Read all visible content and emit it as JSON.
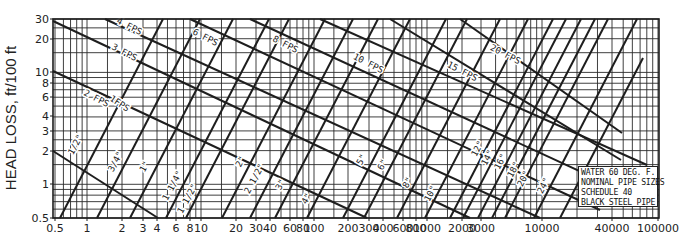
{
  "chart_data": {
    "type": "line",
    "title": "",
    "xlabel": "",
    "ylabel": "HEAD LOSS, ft/100 ft",
    "x_scale": "log",
    "y_scale": "log",
    "xlim": [
      0.5,
      100000
    ],
    "ylim": [
      0.5,
      30
    ],
    "grid": true,
    "x_ticks": [
      {
        "v": 0.5,
        "label": "0.5",
        "px": 55
      },
      {
        "v": 1,
        "label": "1",
        "px": 87
      },
      {
        "v": 2,
        "label": "2",
        "px": 122
      },
      {
        "v": 3,
        "label": "3",
        "px": 143
      },
      {
        "v": 4,
        "label": "4",
        "px": 157
      },
      {
        "v": 6,
        "label": "6",
        "px": 176
      },
      {
        "v": 8,
        "label": "8",
        "px": 190
      },
      {
        "v": 10,
        "label": "10",
        "px": 201
      },
      {
        "v": 20,
        "label": "20",
        "px": 236
      },
      {
        "v": 30,
        "label": "30",
        "px": 256
      },
      {
        "v": 40,
        "label": "40",
        "px": 270
      },
      {
        "v": 60,
        "label": "60",
        "px": 290
      },
      {
        "v": 80,
        "label": "80",
        "px": 303
      },
      {
        "v": 100,
        "label": "100",
        "px": 314
      },
      {
        "v": 200,
        "label": "200",
        "px": 348
      },
      {
        "v": 300,
        "label": "300",
        "px": 369
      },
      {
        "v": 400,
        "label": "400",
        "px": 383
      },
      {
        "v": 600,
        "label": "600",
        "px": 403
      },
      {
        "v": 800,
        "label": "800",
        "px": 416
      },
      {
        "v": 1000,
        "label": "1000",
        "px": 427
      },
      {
        "v": 2000,
        "label": "2000",
        "px": 462
      },
      {
        "v": 3000,
        "label": "3000",
        "px": 481
      },
      {
        "v": 10000,
        "label": "10000",
        "px": 542
      },
      {
        "v": 40000,
        "label": "40000",
        "px": 612
      },
      {
        "v": 100000,
        "label": "100000",
        "px": 658
      }
    ],
    "y_ticks": [
      {
        "v": 30,
        "label": "30",
        "px": 19
      },
      {
        "v": 20,
        "label": "20",
        "px": 39
      },
      {
        "v": 10,
        "label": "10",
        "px": 72
      },
      {
        "v": 8,
        "label": "8",
        "px": 83
      },
      {
        "v": 6,
        "label": "6",
        "px": 97
      },
      {
        "v": 4,
        "label": "4",
        "px": 116
      },
      {
        "v": 3,
        "label": "3",
        "px": 131
      },
      {
        "v": 2,
        "label": "2",
        "px": 151
      },
      {
        "v": 1,
        "label": "1",
        "px": 184
      },
      {
        "v": 0.5,
        "label": "0.5",
        "px": 218
      }
    ],
    "series_velocity": [
      {
        "name": "1 FPS",
        "label": "1FPS",
        "points_px": [
          [
            53,
            151
          ],
          [
            158,
            218
          ]
        ],
        "label_px": [
          118,
          106
        ],
        "label_angle": 33
      },
      {
        "name": "2 FPS",
        "label": "2 FPS",
        "points_px": [
          [
            53,
            71
          ],
          [
            367,
            218
          ]
        ],
        "label_px": [
          95,
          101
        ],
        "label_angle": 27
      },
      {
        "name": "3 FPS",
        "label": "3 FPS",
        "points_px": [
          [
            53,
            21
          ],
          [
            470,
            218
          ]
        ],
        "label_px": [
          123,
          55
        ],
        "label_angle": 27
      },
      {
        "name": "4 FPS",
        "label": "4 FPS",
        "points_px": [
          [
            105,
            19
          ],
          [
            540,
            218
          ]
        ],
        "label_px": [
          128,
          29
        ],
        "label_angle": 27
      },
      {
        "name": "6 FPS",
        "label": "6 FPS",
        "points_px": [
          [
            190,
            19
          ],
          [
            600,
            210
          ]
        ],
        "label_px": [
          204,
          40
        ],
        "label_angle": 27
      },
      {
        "name": "8 FPS",
        "label": "8 FPS",
        "points_px": [
          [
            250,
            19
          ],
          [
            640,
            199
          ]
        ],
        "label_px": [
          284,
          47
        ],
        "label_angle": 27
      },
      {
        "name": "10 FPS",
        "label": "10 FPS",
        "points_px": [
          [
            320,
            19
          ],
          [
            647,
            165
          ]
        ],
        "label_px": [
          367,
          66
        ],
        "label_angle": 27
      },
      {
        "name": "15 FPS",
        "label": "15 FPS",
        "points_px": [
          [
            390,
            19
          ],
          [
            621,
            160
          ]
        ],
        "label_px": [
          461,
          74
        ],
        "label_angle": 27
      },
      {
        "name": "20 FPS",
        "label": "20 FPS",
        "points_px": [
          [
            460,
            19
          ],
          [
            622,
            133
          ]
        ],
        "label_px": [
          504,
          57
        ],
        "label_angle": 27
      }
    ],
    "series_pipe": [
      {
        "name": "1/2\"",
        "label": "1/2\"",
        "points_px": [
          [
            60,
            218
          ],
          [
            163,
            19
          ]
        ],
        "label_px": [
          78,
          146
        ]
      },
      {
        "name": "3/4\"",
        "label": "3/4\"",
        "points_px": [
          [
            97,
            218
          ],
          [
            200,
            19
          ]
        ],
        "label_px": [
          118,
          163
        ]
      },
      {
        "name": "1\"",
        "label": "1\"",
        "points_px": [
          [
            130,
            218
          ],
          [
            233,
            19
          ]
        ],
        "label_px": [
          147,
          168
        ]
      },
      {
        "name": "1 1/4\"",
        "label": "1 1/4\"",
        "points_px": [
          [
            166,
            218
          ],
          [
            269,
            19
          ]
        ],
        "label_px": [
          175,
          187
        ]
      },
      {
        "name": "1 1/2\"",
        "label": "1 1/2\"",
        "points_px": [
          [
            186,
            218
          ],
          [
            289,
            19
          ]
        ],
        "label_px": [
          190,
          200
        ]
      },
      {
        "name": "2\"",
        "label": "2\"",
        "points_px": [
          [
            222,
            218
          ],
          [
            325,
            19
          ]
        ],
        "label_px": [
          243,
          163
        ]
      },
      {
        "name": "2 1/2\"",
        "label": "2 1/2\"",
        "points_px": [
          [
            250,
            218
          ],
          [
            353,
            19
          ]
        ],
        "label_px": [
          257,
          180
        ]
      },
      {
        "name": "3\"",
        "label": "3\"",
        "points_px": [
          [
            275,
            218
          ],
          [
            378,
            19
          ]
        ],
        "label_px": [
          283,
          186
        ]
      },
      {
        "name": "4\"",
        "label": "4\"",
        "points_px": [
          [
            307,
            218
          ],
          [
            410,
            19
          ]
        ],
        "label_px": [
          309,
          200
        ]
      },
      {
        "name": "5\"",
        "label": "5\"",
        "points_px": [
          [
            343,
            218
          ],
          [
            446,
            19
          ]
        ],
        "label_px": [
          364,
          161
        ]
      },
      {
        "name": "6\"",
        "label": "6\"",
        "points_px": [
          [
            364,
            218
          ],
          [
            467,
            19
          ]
        ],
        "label_px": [
          385,
          166
        ]
      },
      {
        "name": "8\"",
        "label": "8\"",
        "points_px": [
          [
            397,
            218
          ],
          [
            500,
            19
          ]
        ],
        "label_px": [
          410,
          184
        ]
      },
      {
        "name": "10\"",
        "label": "10\"",
        "points_px": [
          [
            425,
            218
          ],
          [
            528,
            19
          ]
        ],
        "label_px": [
          433,
          195
        ]
      },
      {
        "name": "12\"",
        "label": "12\"",
        "points_px": [
          [
            450,
            218
          ],
          [
            553,
            19
          ]
        ],
        "label_px": [
          480,
          150
        ]
      },
      {
        "name": "14\"",
        "label": "14\"",
        "points_px": [
          [
            463,
            218
          ],
          [
            566,
            19
          ]
        ],
        "label_px": [
          490,
          159
        ]
      },
      {
        "name": "16\"",
        "label": "16\"",
        "points_px": [
          [
            478,
            218
          ],
          [
            581,
            19
          ]
        ],
        "label_px": [
          503,
          163
        ]
      },
      {
        "name": "18\"",
        "label": "18\"",
        "points_px": [
          [
            492,
            218
          ],
          [
            595,
            19
          ]
        ],
        "label_px": [
          516,
          171
        ]
      },
      {
        "name": "20\"",
        "label": "20\"",
        "points_px": [
          [
            505,
            218
          ],
          [
            608,
            19
          ]
        ],
        "label_px": [
          526,
          180
        ]
      },
      {
        "name": "24\"",
        "label": "24\"",
        "points_px": [
          [
            534,
            218
          ],
          [
            637,
            19
          ]
        ],
        "label_px": [
          546,
          187
        ]
      },
      {
        "name": "extra",
        "label": "",
        "points_px": [
          [
            560,
            218
          ],
          [
            643,
            58
          ]
        ],
        "label_px": [
          0,
          0
        ]
      }
    ],
    "legend": [
      "WATER 60 DEG. F.",
      "NOMINAL PIPE SIZES",
      "SCHEDULE 40",
      "BLACK STEEL PIPE"
    ]
  },
  "axis": {
    "ylabel": "HEAD LOSS, ft/100 ft"
  },
  "legend": {
    "line1": "WATER 60 DEG. F.",
    "line2": "NOMINAL PIPE SIZES",
    "line3": "SCHEDULE 40",
    "line4": "BLACK STEEL PIPE"
  },
  "plot": {
    "left": 53,
    "right": 659,
    "top": 19,
    "bottom": 218
  },
  "colors": {
    "ink": "#1e1e1e",
    "grid": "#2a2a2a",
    "background": "#ffffff"
  }
}
